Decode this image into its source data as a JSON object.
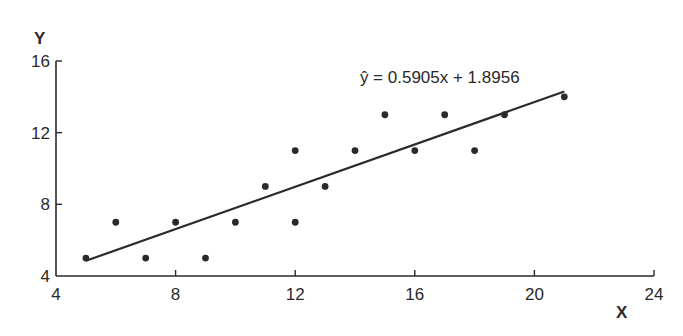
{
  "chart_data": {
    "type": "scatter",
    "title": "",
    "xlabel": "X",
    "ylabel": "Y",
    "xlim": [
      4,
      24
    ],
    "ylim": [
      4,
      16
    ],
    "x_ticks": [
      4,
      8,
      12,
      16,
      20,
      24
    ],
    "y_ticks": [
      4,
      8,
      12,
      16
    ],
    "grid": false,
    "legend": null,
    "points": [
      {
        "x": 5,
        "y": 5
      },
      {
        "x": 6,
        "y": 7
      },
      {
        "x": 7,
        "y": 5
      },
      {
        "x": 8,
        "y": 7
      },
      {
        "x": 9,
        "y": 5
      },
      {
        "x": 10,
        "y": 7
      },
      {
        "x": 11,
        "y": 9
      },
      {
        "x": 12,
        "y": 11
      },
      {
        "x": 12,
        "y": 7
      },
      {
        "x": 13,
        "y": 9
      },
      {
        "x": 14,
        "y": 11
      },
      {
        "x": 15,
        "y": 13
      },
      {
        "x": 16,
        "y": 11
      },
      {
        "x": 17,
        "y": 13
      },
      {
        "x": 18,
        "y": 11
      },
      {
        "x": 19,
        "y": 13
      },
      {
        "x": 21,
        "y": 14
      }
    ],
    "regression_line": {
      "slope": 0.5905,
      "intercept": 1.8956,
      "x_start": 5,
      "x_end": 21
    },
    "annotations": [
      {
        "text": "ŷ = 0.5905x + 1.8956",
        "x": 15.1,
        "y": 15.2
      }
    ]
  },
  "colors": {
    "ink": "#2a2a2a",
    "background": "#ffffff"
  }
}
